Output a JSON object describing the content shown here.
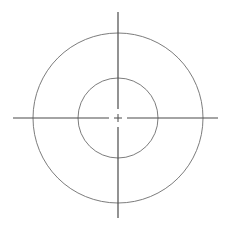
{
  "figure": {
    "name": "concentric-circles-crosshair-target",
    "width": 232,
    "height": 229,
    "background_color": "#ffffff"
  },
  "geometry": {
    "center": {
      "x": 118,
      "y": 118
    },
    "outer_circle": {
      "label": "outer circle",
      "radius": 85,
      "stroke_color": "#6d6d6d",
      "stroke_width": 0.9,
      "fill": "none"
    },
    "inner_circle": {
      "label": "inner circle",
      "radius": 40,
      "stroke_color": "#6d6d6d",
      "stroke_width": 0.9,
      "fill": "none"
    },
    "vertical_axis": {
      "label": "vertical crosshair line",
      "x": 118,
      "y_start": 12,
      "y_end": 218,
      "gap_half_length": 9,
      "stroke_color": "#4a4a4a",
      "stroke_width": 1.2
    },
    "horizontal_axis": {
      "label": "horizontal crosshair line",
      "y": 118,
      "x_start": 13,
      "x_end": 218,
      "gap_half_length": 9,
      "stroke_color": "#4a4a4a",
      "stroke_width": 1.2
    },
    "center_mark": {
      "label": "center plus mark",
      "arm_length": 4,
      "stroke_color": "#4a4a4a",
      "stroke_width": 1
    }
  },
  "chart_data": {
    "type": "scatter",
    "subtitle": "",
    "xlabel": "",
    "ylabel": "",
    "xlim": [
      -116,
      116
    ],
    "ylim": [
      -116,
      113
    ],
    "grid": false,
    "legend": null,
    "xticks": [],
    "yticks": [],
    "annotations": [
      {
        "label": "center",
        "x": 0,
        "y": 0
      }
    ],
    "series": [
      {
        "name": "outer circle",
        "shape": "circle",
        "center": [
          0,
          0
        ],
        "radius": 85,
        "values": []
      },
      {
        "name": "inner circle",
        "shape": "circle",
        "center": [
          0,
          0
        ],
        "radius": 40,
        "values": []
      },
      {
        "name": "vertical crosshair",
        "shape": "line",
        "x": [
          0,
          0
        ],
        "y": [
          -100,
          106
        ]
      },
      {
        "name": "horizontal crosshair",
        "shape": "line",
        "x": [
          -105,
          100
        ],
        "y": [
          0,
          0
        ]
      }
    ]
  }
}
